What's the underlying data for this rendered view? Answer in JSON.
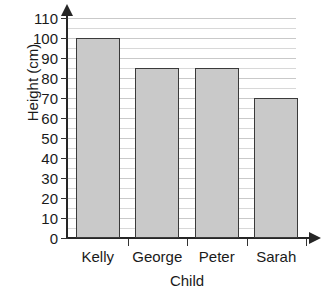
{
  "chart_data": {
    "type": "bar",
    "title": "",
    "subtitle": "",
    "xlabel": "Child",
    "ylabel": "Height (cm)",
    "categories": [
      "Kelly",
      "George",
      "Peter",
      "Sarah"
    ],
    "values": [
      100,
      85,
      85,
      70
    ],
    "series": [
      {
        "name": "Height",
        "values": [
          100,
          85,
          85,
          70
        ]
      }
    ],
    "ylim": [
      0,
      110
    ],
    "ytick_labels": [
      "0",
      "10",
      "20",
      "30",
      "40",
      "50",
      "60",
      "70",
      "80",
      "90",
      "100",
      "110"
    ],
    "ytick_values": [
      0,
      10,
      20,
      30,
      40,
      50,
      60,
      70,
      80,
      90,
      100,
      110
    ],
    "ytick_step": 10,
    "minor_gridline_step": 5,
    "grid": true,
    "grid_axis": "y",
    "legend": false,
    "legend_position": "none",
    "annotations": [],
    "colors": {
      "bar_fill": "#c9c9c9",
      "bar_border": "#3a3a3a",
      "axis": "#262626",
      "gridline_major": "#c9c9c9",
      "gridline_minor": "#d8d8d8",
      "text": "#1a1a1a",
      "background": "#ffffff"
    },
    "axis_arrows": {
      "y": "up-arrow",
      "x": "right-arrow"
    }
  }
}
